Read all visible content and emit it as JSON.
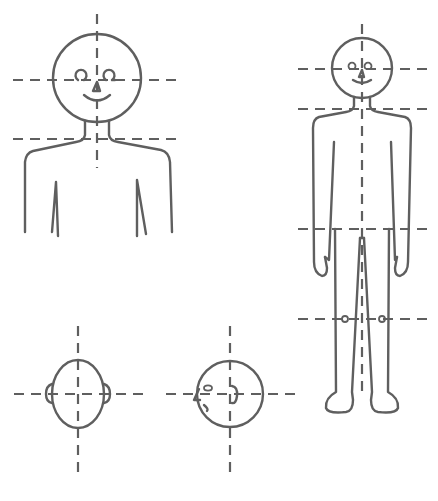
{
  "diagram": {
    "colors": {
      "line": "#5f5f5f",
      "background": "#ffffff"
    },
    "figures": [
      {
        "id": "bust-front",
        "label": "",
        "view": "front head and shoulders"
      },
      {
        "id": "full-body-front",
        "label": "",
        "view": "full standing figure front"
      },
      {
        "id": "head-top",
        "label": "",
        "view": "head from above with ears"
      },
      {
        "id": "head-side",
        "label": "",
        "view": "head from above turned sideways (nose, eye, ear)"
      }
    ],
    "guides": {
      "style": "dashed",
      "bust": [
        "vertical-center",
        "eye-line",
        "shoulder-line"
      ],
      "full_body": [
        "vertical-center",
        "eye-line",
        "shoulder-line",
        "hip-line",
        "knee-line"
      ],
      "head_top": [
        "vertical-center",
        "ear-line"
      ],
      "head_side": [
        "vertical-center",
        "ear-line"
      ]
    }
  }
}
